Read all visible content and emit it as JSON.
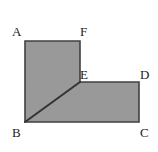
{
  "figure": {
    "kind": "geometry-diagram",
    "canvas": {
      "width": 158,
      "height": 152
    },
    "colors": {
      "background": "#ffffff",
      "fill": "#999999",
      "stroke": "#404040",
      "diagonal": "#333333",
      "label_text": "#222222"
    },
    "polygon": {
      "name": "AFEDCB",
      "points_svg": "25,41 80,41 80,82 139,82 139,122 25,122",
      "stroke_width": 1.6
    },
    "diagonal": {
      "name": "BE",
      "from": "B",
      "to": "E",
      "x1": 25,
      "y1": 122,
      "x2": 80,
      "y2": 82,
      "stroke_width": 2
    },
    "vertices": [
      {
        "id": "A",
        "label": "A",
        "x": 25,
        "y": 41,
        "label_left": 12,
        "label_top": 25
      },
      {
        "id": "F",
        "label": "F",
        "x": 80,
        "y": 41,
        "label_left": 80,
        "label_top": 25
      },
      {
        "id": "E",
        "label": "E",
        "x": 80,
        "y": 82,
        "label_left": 80,
        "label_top": 68
      },
      {
        "id": "D",
        "label": "D",
        "x": 139,
        "y": 82,
        "label_left": 140,
        "label_top": 68
      },
      {
        "id": "C",
        "label": "C",
        "x": 139,
        "y": 122,
        "label_left": 140,
        "label_top": 126
      },
      {
        "id": "B",
        "label": "B",
        "x": 25,
        "y": 122,
        "label_left": 12,
        "label_top": 126
      }
    ]
  }
}
